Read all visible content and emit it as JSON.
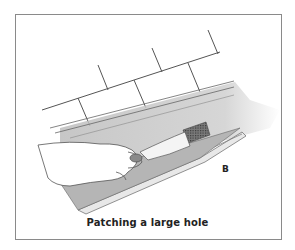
{
  "figure": {
    "label": "B",
    "caption": "Patching a large hole",
    "colors": {
      "frame": "#8a8a8a",
      "line": "#555555",
      "gutter_fill": "#bdbdbd",
      "patch_mesh": "#5a5a5a",
      "text": "#222222"
    }
  }
}
